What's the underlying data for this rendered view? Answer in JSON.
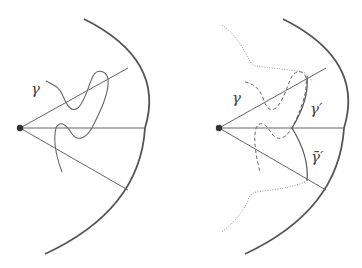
{
  "diagram": {
    "left_panel": {
      "labels": {
        "gamma": "γ"
      },
      "elements": [
        "center-point",
        "outer-arc",
        "upper-ray",
        "middle-ray",
        "lower-ray",
        "curve-gamma"
      ]
    },
    "right_panel": {
      "labels": {
        "gamma": "γ",
        "gamma_prime": "γ′",
        "gamma_bar_prime": "γ̄′"
      },
      "elements": [
        "center-point",
        "outer-arc",
        "upper-ray",
        "middle-ray",
        "lower-ray",
        "dashed-curve-gamma",
        "curve-gamma-prime",
        "curve-gamma-bar-prime",
        "dotted-upper-boundary",
        "dotted-lower-boundary"
      ]
    },
    "colors": {
      "line": "#666666",
      "arc": "#555555",
      "dot": "#333333",
      "dotted": "#999999"
    }
  }
}
